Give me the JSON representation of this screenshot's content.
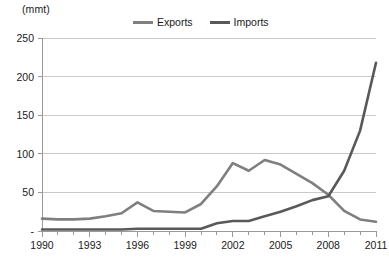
{
  "chart_data": {
    "type": "line",
    "title": "",
    "subtitle": "",
    "unit_label": "(mmt)",
    "xlabel": "",
    "ylabel": "",
    "ylim": [
      0,
      250
    ],
    "xlim": [
      1990,
      2011
    ],
    "grid": "horizontal",
    "legend_position": "top-center",
    "y_ticks": [
      "-",
      "50",
      "100",
      "150",
      "200",
      "250"
    ],
    "y_tick_values": [
      0,
      50,
      100,
      150,
      200,
      250
    ],
    "x_ticks": [
      "1990",
      "1993",
      "1996",
      "1999",
      "2002",
      "2005",
      "2008",
      "2011"
    ],
    "x_tick_values": [
      1990,
      1993,
      1996,
      1999,
      2002,
      2005,
      2008,
      2011
    ],
    "x_minor_tick_interval": 1,
    "x": [
      1990,
      1991,
      1992,
      1993,
      1994,
      1995,
      1996,
      1997,
      1998,
      1999,
      2000,
      2001,
      2002,
      2003,
      2004,
      2005,
      2006,
      2007,
      2008,
      2009,
      2010,
      2011
    ],
    "series": [
      {
        "name": "Exports",
        "color": "#7f7f7f",
        "values": [
          16,
          15,
          15,
          16,
          19,
          23,
          37,
          26,
          25,
          24,
          35,
          58,
          88,
          78,
          92,
          86,
          74,
          62,
          47,
          26,
          15,
          12
        ]
      },
      {
        "name": "Imports",
        "color": "#59595b",
        "values": [
          2,
          2,
          2,
          2,
          2,
          2,
          3,
          3,
          3,
          3,
          3,
          10,
          13,
          13,
          19,
          25,
          32,
          40,
          45,
          78,
          130,
          218
        ]
      }
    ]
  },
  "legend": {
    "items": [
      {
        "label": "Exports",
        "color": "#7f7f7f"
      },
      {
        "label": "Imports",
        "color": "#59595b"
      }
    ]
  },
  "axes": {
    "unit": "(mmt)"
  },
  "colors": {
    "exports": "#7f7f7f",
    "imports": "#59595b",
    "gridline": "#c9c9c9",
    "axis": "#9a9a9a",
    "text": "#1a1a1a",
    "background": "#ffffff"
  }
}
